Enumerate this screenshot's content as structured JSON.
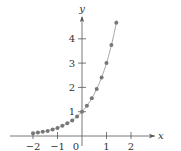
{
  "chart_data": {
    "type": "scatter",
    "title": "",
    "function": "y = 3^x",
    "xlabel": "x",
    "ylabel": "y",
    "xlim": [
      -2.9,
      3.0
    ],
    "ylim": [
      -0.3,
      5.0
    ],
    "grid": false,
    "legend": null,
    "x_ticks": [
      -2,
      -1,
      0,
      1,
      2
    ],
    "x_tick_labels": [
      "−2",
      "−1",
      "0",
      "1",
      "2"
    ],
    "y_ticks": [
      1,
      2,
      3,
      4
    ],
    "y_tick_labels": [
      "1",
      "2",
      "3",
      "4"
    ],
    "series": [
      {
        "name": "points",
        "x": [
          -2.0,
          -1.8,
          -1.6,
          -1.4,
          -1.2,
          -1.0,
          -0.8,
          -0.6,
          -0.4,
          -0.2,
          0.0,
          0.2,
          0.4,
          0.6,
          0.8,
          1.0,
          1.2,
          1.4
        ],
        "y": [
          0.11,
          0.14,
          0.17,
          0.21,
          0.27,
          0.33,
          0.42,
          0.52,
          0.64,
          0.8,
          1.0,
          1.25,
          1.55,
          1.93,
          2.41,
          3.0,
          3.74,
          4.66
        ]
      }
    ],
    "curve": {
      "x_range": [
        -2.0,
        1.42
      ],
      "color": "#9a9a9a"
    },
    "point_color": "#777777",
    "axis_color": "#555555"
  }
}
